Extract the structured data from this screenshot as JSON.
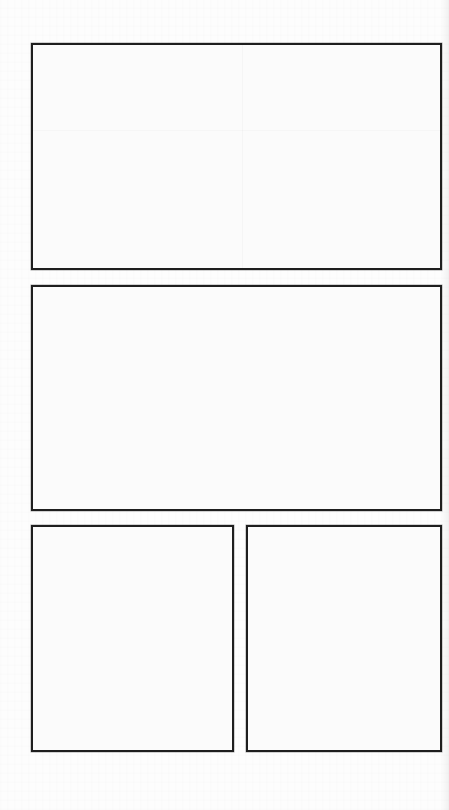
{
  "page": {
    "type": "blank comic / storyboard panel template",
    "background_color": "#fdfdfd",
    "border_color": "#1e1e1e"
  },
  "panels": [
    {
      "id": 1,
      "label": "Panel 1",
      "content": ""
    },
    {
      "id": 2,
      "label": "Panel 2",
      "content": ""
    },
    {
      "id": 3,
      "label": "Panel 3",
      "content": ""
    },
    {
      "id": 4,
      "label": "Panel 4",
      "content": ""
    }
  ]
}
